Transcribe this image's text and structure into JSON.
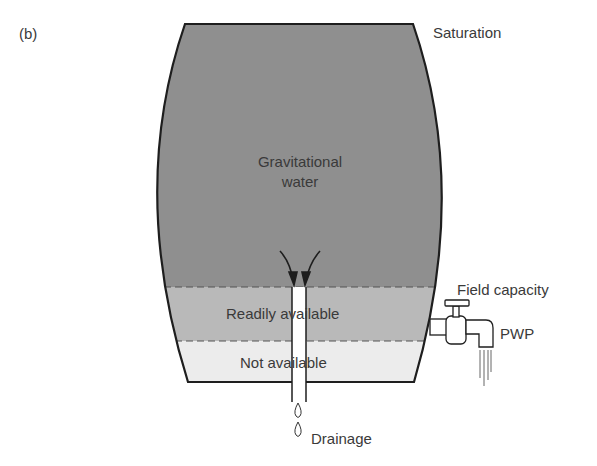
{
  "figure": {
    "panel_label": "(b)",
    "labels": {
      "saturation": "Saturation",
      "gravitational_water_line1": "Gravitational",
      "gravitational_water_line2": "water",
      "readily_available": "Readily available",
      "not_available": "Not available",
      "field_capacity": "Field capacity",
      "pwp": "PWP",
      "drainage": "Drainage"
    },
    "colors": {
      "gravitational_zone": "#8f8f8f",
      "readily_available_zone": "#b9b9b9",
      "not_available_zone": "#ececec",
      "outline": "#1e1e1e",
      "dashed_line": "#555555",
      "text": "#3a3a3a"
    }
  }
}
